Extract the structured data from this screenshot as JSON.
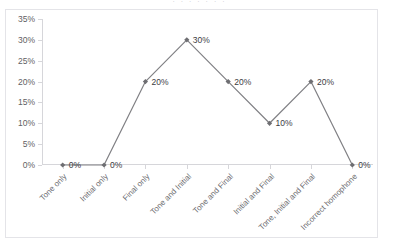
{
  "title_sliver": "· · ·   ·   ·    ·    ·",
  "chart_data": {
    "type": "line",
    "title": "",
    "subtitle": "",
    "xlabel": "",
    "ylabel": "",
    "categories": [
      "Tone only",
      "Initial only",
      "Final only",
      "Tone and Initial",
      "Tone and Final",
      "Initial and Final",
      "Tone, Initial and Final",
      "Incorrect homophone"
    ],
    "values": [
      0,
      0,
      20,
      30,
      20,
      10,
      20,
      0
    ],
    "point_labels": [
      "0%",
      "0%",
      "20%",
      "30%",
      "20%",
      "10%",
      "20%",
      "0%"
    ],
    "ylim": [
      0,
      35
    ],
    "ytick_labels": [
      "35%",
      "30%",
      "25%",
      "20%",
      "15%",
      "10%",
      "5%",
      "0%"
    ],
    "ytick_values": [
      35,
      30,
      25,
      20,
      15,
      10,
      5,
      0
    ],
    "grid": false,
    "legend": "none",
    "series_color": "#808084",
    "marker_color": "#6e6e72",
    "axis_color": "#d6d6da",
    "label_color": "#6a6a6e",
    "border_color": "#e4e4e8",
    "background_color": "#ffffff"
  }
}
